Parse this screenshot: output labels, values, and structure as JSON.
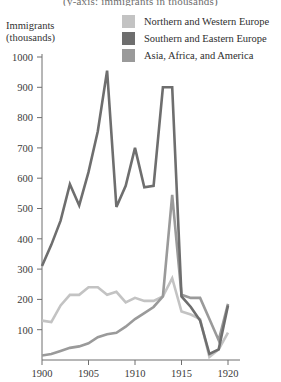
{
  "title": "(y-axis: immigrants in thousands)",
  "axis": {
    "y_caption_line1": "Immigrants",
    "y_caption_line2": "(thousands)",
    "y_ticks": [
      100,
      200,
      300,
      400,
      500,
      600,
      700,
      800,
      900,
      1000
    ],
    "x_ticks": [
      1900,
      1905,
      1910,
      1915,
      1920
    ],
    "ylim": [
      0,
      1000
    ],
    "xlim": [
      1900,
      1920
    ]
  },
  "colors": {
    "northern_western": "#c3c3c3",
    "southern_eastern": "#6e6e6e",
    "asia_africa_america": "#9a9a9a",
    "axis": "#6f6f6f",
    "text": "#3a3a3a"
  },
  "legend": {
    "position": "top-right",
    "entries": [
      {
        "label": "Northern and Western Europe",
        "color": "#c3c3c3",
        "swatch_name": "legend-swatch-northern-western"
      },
      {
        "label": "Southern and Eastern Europe",
        "color": "#6e6e6e",
        "swatch_name": "legend-swatch-southern-eastern"
      },
      {
        "label": "Asia, Africa, and America",
        "color": "#9a9a9a",
        "swatch_name": "legend-swatch-asia-africa-america"
      }
    ]
  },
  "chart_data": {
    "type": "line",
    "title": "(y-axis: immigrants in thousands)",
    "xlabel": "",
    "ylabel": "Immigrants (thousands)",
    "xlim": [
      1900,
      1920
    ],
    "ylim": [
      0,
      1000
    ],
    "grid": false,
    "legend_position": "top-right",
    "x": [
      1900,
      1901,
      1902,
      1903,
      1904,
      1905,
      1906,
      1907,
      1908,
      1909,
      1910,
      1911,
      1912,
      1913,
      1914,
      1915,
      1916,
      1917,
      1918,
      1919,
      1920
    ],
    "series": [
      {
        "name": "Northern and Western Europe",
        "color": "#c3c3c3",
        "values": [
          130,
          125,
          180,
          215,
          215,
          240,
          240,
          215,
          225,
          190,
          205,
          195,
          195,
          210,
          270,
          160,
          150,
          135,
          10,
          35,
          90
        ]
      },
      {
        "name": "Southern and Eastern Europe",
        "color": "#6e6e6e",
        "values": [
          310,
          380,
          460,
          580,
          510,
          620,
          755,
          955,
          505,
          575,
          700,
          570,
          575,
          900,
          900,
          210,
          175,
          130,
          20,
          35,
          180
        ]
      },
      {
        "name": "Asia, Africa, and America",
        "color": "#9a9a9a",
        "values": [
          15,
          20,
          30,
          40,
          45,
          55,
          75,
          85,
          90,
          110,
          135,
          155,
          175,
          210,
          545,
          215,
          205,
          205,
          135,
          65,
          185
        ]
      }
    ]
  }
}
